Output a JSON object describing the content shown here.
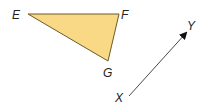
{
  "diagram": {
    "triangle": {
      "fill": "#f9d985",
      "stroke": "#6b5a2a",
      "vertices": [
        {
          "name": "E",
          "x": 28,
          "y": 14,
          "label_x": 12,
          "label_y": 19
        },
        {
          "name": "F",
          "x": 119,
          "y": 14,
          "label_x": 121,
          "label_y": 19
        },
        {
          "name": "G",
          "x": 108,
          "y": 61,
          "label_x": 103,
          "label_y": 77
        }
      ]
    },
    "vector": {
      "from": {
        "name": "X",
        "x": 129,
        "y": 96,
        "label_x": 115,
        "label_y": 102
      },
      "to": {
        "name": "Y",
        "x": 186,
        "y": 33,
        "label_x": 187,
        "label_y": 30
      },
      "stroke": "#333333"
    }
  }
}
